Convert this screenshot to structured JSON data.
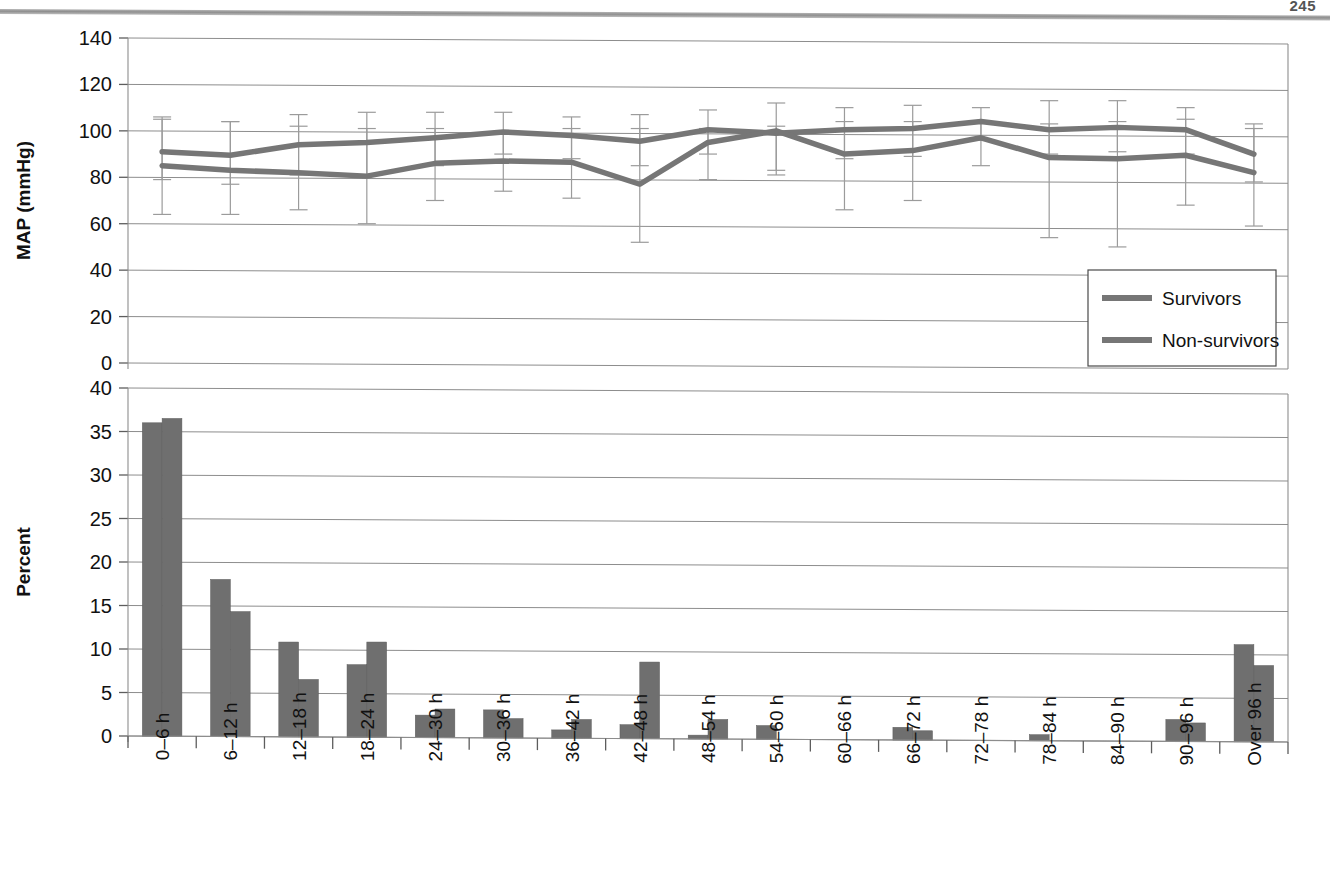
{
  "page": {
    "number": "245",
    "running_head": ""
  },
  "chart_data": [
    {
      "id": "map-chart",
      "type": "line",
      "title": "",
      "xlabel": "",
      "ylabel": "MAP (mmHg)",
      "ylim": [
        0,
        140
      ],
      "yticks": [
        0,
        20,
        40,
        60,
        80,
        100,
        120,
        140
      ],
      "grid": true,
      "legend_position": "bottom-right",
      "categories": [
        "0–6 h",
        "6–12 h",
        "12–18 h",
        "18–24 h",
        "24–30 h",
        "30–36 h",
        "36–42 h",
        "42–48 h",
        "48–54 h",
        "54–60 h",
        "60–66 h",
        "66–72 h",
        "72–78 h",
        "78–84 h",
        "84–90 h",
        "90–96 h",
        "Over 96 h"
      ],
      "series": [
        {
          "name": "Survivors",
          "color": "#767676",
          "values": [
            91,
            89.5,
            94,
            95,
            97,
            99.5,
            98,
            95.5,
            100.5,
            99,
            100.5,
            101,
            104,
            100.5,
            101.5,
            100.5,
            90
          ],
          "err_upper": [
            105,
            104,
            107,
            108,
            108,
            108,
            106,
            107,
            109,
            112,
            110,
            111,
            110,
            113,
            113,
            110,
            103
          ],
          "err_lower": [
            79,
            77,
            81,
            81,
            85,
            90,
            88,
            85,
            90,
            83,
            88,
            89,
            96,
            90,
            91,
            90,
            78
          ]
        },
        {
          "name": "Non-survivors",
          "color": "#767676",
          "values": [
            85,
            83,
            82,
            80.5,
            86,
            87,
            86.5,
            77,
            95,
            100,
            90,
            91.5,
            97,
            88.5,
            88,
            89.5,
            82
          ],
          "err_upper": [
            106,
            104,
            102,
            101,
            101,
            100,
            101,
            101,
            101,
            102,
            104,
            104,
            104,
            103,
            104,
            105,
            101
          ],
          "err_lower": [
            64,
            64,
            66,
            60,
            70,
            74,
            71,
            52,
            79,
            81,
            66,
            70,
            85,
            54,
            50,
            68,
            59
          ]
        }
      ]
    },
    {
      "id": "percent-chart",
      "type": "bar",
      "title": "",
      "xlabel": "",
      "ylabel": "Percent",
      "ylim": [
        0,
        40
      ],
      "yticks": [
        0,
        5,
        10,
        15,
        20,
        25,
        30,
        35,
        40
      ],
      "grid": true,
      "categories": [
        "0–6 h",
        "6–12 h",
        "12–18 h",
        "18–24 h",
        "24–30 h",
        "30–36 h",
        "36–42 h",
        "42–48 h",
        "48–54 h",
        "54–60 h",
        "60–66 h",
        "66–72 h",
        "72–78 h",
        "78–84 h",
        "84–90 h",
        "90–96 h",
        "Over 96 h"
      ],
      "series": [
        {
          "name": "Survivors",
          "color": "#6f6f6f",
          "values": [
            36.0,
            18.0,
            10.8,
            8.2,
            2.4,
            3.0,
            0.7,
            1.3,
            0.1,
            1.2,
            0.0,
            1.0,
            0.0,
            0.15,
            0.0,
            1.9,
            10.5
          ]
        },
        {
          "name": "Non-survivors",
          "color": "#6f6f6f",
          "values": [
            36.5,
            14.3,
            6.5,
            10.8,
            3.1,
            2.0,
            1.9,
            8.5,
            1.9,
            0.0,
            0.0,
            0.6,
            0.0,
            0.0,
            0.0,
            1.5,
            8.1
          ]
        }
      ]
    }
  ]
}
